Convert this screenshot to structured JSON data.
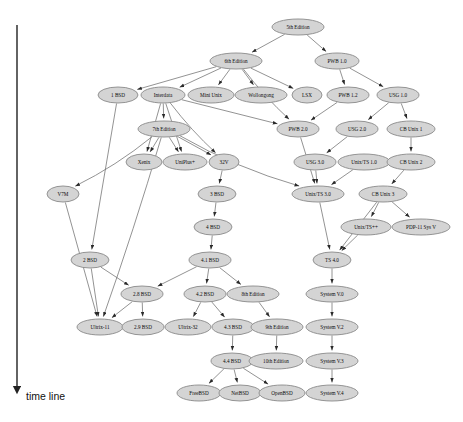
{
  "diagram": {
    "node_fill": "#d4d4d4",
    "node_stroke": "#8a8a8a",
    "edge_color": "#6f6f6f",
    "axis": {
      "label": "time line",
      "direction": "downward",
      "x": 17,
      "y_top": 25,
      "y_bottom": 390
    },
    "nodes": [
      {
        "id": "5th",
        "label": "5th Edition",
        "x": 298,
        "y": 27,
        "rx": 26,
        "ry": 8
      },
      {
        "id": "6th",
        "label": "6th Edition",
        "x": 236,
        "y": 61,
        "rx": 26,
        "ry": 8
      },
      {
        "id": "pwb10",
        "label": "PWB 1.0",
        "x": 337,
        "y": 61,
        "rx": 22,
        "ry": 8
      },
      {
        "id": "1bsd",
        "label": "1 BSD",
        "x": 118,
        "y": 95,
        "rx": 20,
        "ry": 8
      },
      {
        "id": "interdata",
        "label": "Interdata",
        "x": 163,
        "y": 95,
        "rx": 22,
        "ry": 8
      },
      {
        "id": "minix",
        "label": "Mini Unix",
        "x": 211,
        "y": 95,
        "rx": 23,
        "ry": 8
      },
      {
        "id": "wollong",
        "label": "Wollongong",
        "x": 261,
        "y": 95,
        "rx": 26,
        "ry": 8
      },
      {
        "id": "lsx",
        "label": "LSX",
        "x": 307,
        "y": 95,
        "rx": 15,
        "ry": 8
      },
      {
        "id": "pwb12",
        "label": "PWB 1.2",
        "x": 348,
        "y": 95,
        "rx": 21,
        "ry": 8
      },
      {
        "id": "usg10",
        "label": "USG 1.0",
        "x": 398,
        "y": 95,
        "rx": 21,
        "ry": 8
      },
      {
        "id": "7th",
        "label": "7th Edition",
        "x": 164,
        "y": 129,
        "rx": 26,
        "ry": 8
      },
      {
        "id": "pwb20",
        "label": "PWB 2.0",
        "x": 298,
        "y": 129,
        "rx": 21,
        "ry": 8
      },
      {
        "id": "usg20",
        "label": "USG 2.0",
        "x": 357,
        "y": 129,
        "rx": 21,
        "ry": 8
      },
      {
        "id": "cb1",
        "label": "CB Unix 1",
        "x": 411,
        "y": 129,
        "rx": 24,
        "ry": 8
      },
      {
        "id": "xenix",
        "label": "Xenix",
        "x": 144,
        "y": 162,
        "rx": 18,
        "ry": 8
      },
      {
        "id": "uniplus",
        "label": "UniPlus+",
        "x": 185,
        "y": 162,
        "rx": 22,
        "ry": 8
      },
      {
        "id": "32v",
        "label": "32V",
        "x": 224,
        "y": 162,
        "rx": 15,
        "ry": 8
      },
      {
        "id": "usg30",
        "label": "USG 3.0",
        "x": 315,
        "y": 162,
        "rx": 21,
        "ry": 8
      },
      {
        "id": "uts10",
        "label": "Unix/TS 1.0",
        "x": 364,
        "y": 162,
        "rx": 26,
        "ry": 8
      },
      {
        "id": "cb2",
        "label": "CB Unix 2",
        "x": 411,
        "y": 162,
        "rx": 24,
        "ry": 8
      },
      {
        "id": "v7m",
        "label": "V7M",
        "x": 63,
        "y": 194,
        "rx": 16,
        "ry": 8
      },
      {
        "id": "3bsd",
        "label": "3 BSD",
        "x": 217,
        "y": 194,
        "rx": 19,
        "ry": 8
      },
      {
        "id": "uts30",
        "label": "Unix/TS 3.0",
        "x": 318,
        "y": 194,
        "rx": 26,
        "ry": 8
      },
      {
        "id": "cb3",
        "label": "CB Unix 3",
        "x": 383,
        "y": 194,
        "rx": 24,
        "ry": 8
      },
      {
        "id": "4bsd",
        "label": "4 BSD",
        "x": 213,
        "y": 227,
        "rx": 19,
        "ry": 8
      },
      {
        "id": "utspp",
        "label": "Unix/TS++",
        "x": 366,
        "y": 227,
        "rx": 25,
        "ry": 8
      },
      {
        "id": "pdp11sv",
        "label": "PDP-11 Sys V",
        "x": 421,
        "y": 227,
        "rx": 29,
        "ry": 8
      },
      {
        "id": "2bsd",
        "label": "2 BSD",
        "x": 90,
        "y": 260,
        "rx": 19,
        "ry": 8
      },
      {
        "id": "41bsd",
        "label": "4.1 BSD",
        "x": 210,
        "y": 260,
        "rx": 21,
        "ry": 8
      },
      {
        "id": "ts40",
        "label": "TS 4.0",
        "x": 332,
        "y": 260,
        "rx": 19,
        "ry": 8
      },
      {
        "id": "28bsd",
        "label": "2.8 BSD",
        "x": 142,
        "y": 294,
        "rx": 21,
        "ry": 8
      },
      {
        "id": "42bsd",
        "label": "4.2 BSD",
        "x": 205,
        "y": 294,
        "rx": 21,
        "ry": 8
      },
      {
        "id": "8th",
        "label": "8th Edition",
        "x": 253,
        "y": 294,
        "rx": 26,
        "ry": 8
      },
      {
        "id": "sysv0",
        "label": "System V.0",
        "x": 332,
        "y": 294,
        "rx": 26,
        "ry": 8
      },
      {
        "id": "ultrix11",
        "label": "Ultrix-11",
        "x": 100,
        "y": 327,
        "rx": 23,
        "ry": 8
      },
      {
        "id": "29bsd",
        "label": "2.9 BSD",
        "x": 143,
        "y": 327,
        "rx": 21,
        "ry": 8
      },
      {
        "id": "ultrix32",
        "label": "Ultrix-32",
        "x": 188,
        "y": 327,
        "rx": 23,
        "ry": 8
      },
      {
        "id": "43bsd",
        "label": "4.3 BSD",
        "x": 233,
        "y": 327,
        "rx": 21,
        "ry": 8
      },
      {
        "id": "9th",
        "label": "9th Edition",
        "x": 277,
        "y": 327,
        "rx": 26,
        "ry": 8
      },
      {
        "id": "sysv2",
        "label": "System V.2",
        "x": 332,
        "y": 327,
        "rx": 26,
        "ry": 8
      },
      {
        "id": "44bsd",
        "label": "4.4 BSD",
        "x": 232,
        "y": 361,
        "rx": 21,
        "ry": 8
      },
      {
        "id": "10th",
        "label": "10th Edition",
        "x": 276,
        "y": 361,
        "rx": 27,
        "ry": 8
      },
      {
        "id": "sysv3",
        "label": "System V.3",
        "x": 332,
        "y": 361,
        "rx": 26,
        "ry": 8
      },
      {
        "id": "freebsd",
        "label": "FreeBSD",
        "x": 199,
        "y": 393,
        "rx": 22,
        "ry": 8
      },
      {
        "id": "netbsd",
        "label": "NetBSD",
        "x": 240,
        "y": 393,
        "rx": 21,
        "ry": 8
      },
      {
        "id": "openbsd",
        "label": "OpenBSD",
        "x": 282,
        "y": 393,
        "rx": 23,
        "ry": 8
      },
      {
        "id": "sysv4",
        "label": "System V.4",
        "x": 332,
        "y": 393,
        "rx": 26,
        "ry": 8
      }
    ],
    "edges": [
      {
        "from": "5th",
        "to": "6th"
      },
      {
        "from": "5th",
        "to": "pwb10"
      },
      {
        "from": "6th",
        "to": "1bsd"
      },
      {
        "from": "6th",
        "to": "interdata"
      },
      {
        "from": "6th",
        "to": "minix"
      },
      {
        "from": "6th",
        "to": "wollong"
      },
      {
        "from": "6th",
        "to": "lsx"
      },
      {
        "from": "6th",
        "to": "pwb20"
      },
      {
        "from": "pwb10",
        "to": "pwb12"
      },
      {
        "from": "pwb10",
        "to": "usg10"
      },
      {
        "from": "pwb12",
        "to": "pwb20"
      },
      {
        "from": "usg10",
        "to": "usg20"
      },
      {
        "from": "usg10",
        "to": "cb1"
      },
      {
        "from": "interdata",
        "to": "7th"
      },
      {
        "from": "interdata",
        "to": "xenix"
      },
      {
        "from": "interdata",
        "to": "uniplus"
      },
      {
        "from": "interdata",
        "to": "32v"
      },
      {
        "from": "interdata",
        "to": "pwb20"
      },
      {
        "from": "1bsd",
        "to": "2bsd"
      },
      {
        "from": "7th",
        "to": "xenix"
      },
      {
        "from": "7th",
        "to": "uniplus"
      },
      {
        "from": "7th",
        "to": "32v"
      },
      {
        "from": "7th",
        "to": "v7m"
      },
      {
        "from": "7th",
        "to": "ultrix11"
      },
      {
        "from": "7th",
        "to": "uts30"
      },
      {
        "from": "usg20",
        "to": "usg30"
      },
      {
        "from": "uts10",
        "to": "uts30"
      },
      {
        "from": "usg30",
        "to": "uts30"
      },
      {
        "from": "pwb20",
        "to": "uts30"
      },
      {
        "from": "cb1",
        "to": "cb2"
      },
      {
        "from": "cb2",
        "to": "cb3"
      },
      {
        "from": "32v",
        "to": "3bsd"
      },
      {
        "from": "3bsd",
        "to": "4bsd"
      },
      {
        "from": "4bsd",
        "to": "41bsd"
      },
      {
        "from": "v7m",
        "to": "ultrix11"
      },
      {
        "from": "2bsd",
        "to": "28bsd"
      },
      {
        "from": "2bsd",
        "to": "ultrix11"
      },
      {
        "from": "41bsd",
        "to": "28bsd"
      },
      {
        "from": "41bsd",
        "to": "42bsd"
      },
      {
        "from": "41bsd",
        "to": "8th"
      },
      {
        "from": "28bsd",
        "to": "ultrix11"
      },
      {
        "from": "28bsd",
        "to": "29bsd"
      },
      {
        "from": "42bsd",
        "to": "ultrix32"
      },
      {
        "from": "42bsd",
        "to": "43bsd"
      },
      {
        "from": "8th",
        "to": "9th"
      },
      {
        "from": "43bsd",
        "to": "44bsd"
      },
      {
        "from": "9th",
        "to": "10th"
      },
      {
        "from": "44bsd",
        "to": "freebsd"
      },
      {
        "from": "44bsd",
        "to": "netbsd"
      },
      {
        "from": "44bsd",
        "to": "openbsd"
      },
      {
        "from": "cb3",
        "to": "utspp"
      },
      {
        "from": "cb3",
        "to": "pdp11sv"
      },
      {
        "from": "cb3",
        "to": "ts40"
      },
      {
        "from": "uts30",
        "to": "ts40"
      },
      {
        "from": "utspp",
        "to": "ts40"
      },
      {
        "from": "ts40",
        "to": "sysv0"
      },
      {
        "from": "sysv0",
        "to": "sysv2"
      },
      {
        "from": "sysv2",
        "to": "sysv3"
      },
      {
        "from": "sysv3",
        "to": "sysv4"
      }
    ]
  }
}
